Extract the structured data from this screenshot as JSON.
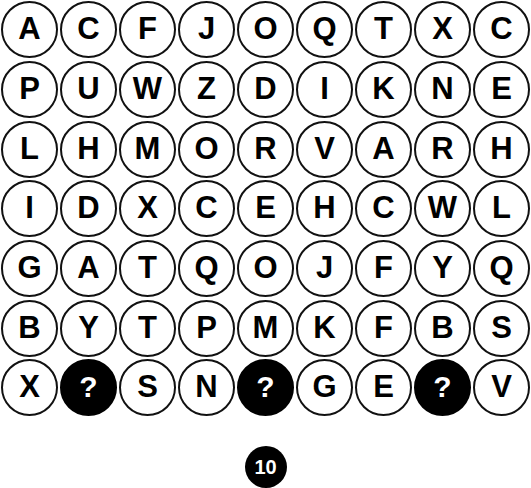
{
  "board": {
    "columns": 9,
    "rows": 7,
    "background_color": "#ffffff",
    "outline_color": "#111111",
    "letter_color": "#000000",
    "filled_color": "#000000",
    "filled_letter_color": "#ffffff",
    "cells": [
      [
        {
          "label": "A",
          "state": "open"
        },
        {
          "label": "C",
          "state": "open"
        },
        {
          "label": "F",
          "state": "open"
        },
        {
          "label": "J",
          "state": "open"
        },
        {
          "label": "O",
          "state": "open"
        },
        {
          "label": "Q",
          "state": "open"
        },
        {
          "label": "T",
          "state": "open"
        },
        {
          "label": "X",
          "state": "open"
        },
        {
          "label": "C",
          "state": "open"
        }
      ],
      [
        {
          "label": "P",
          "state": "open"
        },
        {
          "label": "U",
          "state": "open"
        },
        {
          "label": "W",
          "state": "open"
        },
        {
          "label": "Z",
          "state": "open"
        },
        {
          "label": "D",
          "state": "open"
        },
        {
          "label": "I",
          "state": "open"
        },
        {
          "label": "K",
          "state": "open"
        },
        {
          "label": "N",
          "state": "open"
        },
        {
          "label": "E",
          "state": "open"
        }
      ],
      [
        {
          "label": "L",
          "state": "open"
        },
        {
          "label": "H",
          "state": "open"
        },
        {
          "label": "M",
          "state": "open"
        },
        {
          "label": "O",
          "state": "open"
        },
        {
          "label": "R",
          "state": "open"
        },
        {
          "label": "V",
          "state": "open"
        },
        {
          "label": "A",
          "state": "open"
        },
        {
          "label": "R",
          "state": "open"
        },
        {
          "label": "H",
          "state": "open"
        }
      ],
      [
        {
          "label": "I",
          "state": "open"
        },
        {
          "label": "D",
          "state": "open"
        },
        {
          "label": "X",
          "state": "open"
        },
        {
          "label": "C",
          "state": "open"
        },
        {
          "label": "E",
          "state": "open"
        },
        {
          "label": "H",
          "state": "open"
        },
        {
          "label": "C",
          "state": "open"
        },
        {
          "label": "W",
          "state": "open"
        },
        {
          "label": "L",
          "state": "open"
        }
      ],
      [
        {
          "label": "G",
          "state": "open"
        },
        {
          "label": "A",
          "state": "open"
        },
        {
          "label": "T",
          "state": "open"
        },
        {
          "label": "Q",
          "state": "open"
        },
        {
          "label": "O",
          "state": "open"
        },
        {
          "label": "J",
          "state": "open"
        },
        {
          "label": "F",
          "state": "open"
        },
        {
          "label": "Y",
          "state": "open"
        },
        {
          "label": "Q",
          "state": "open"
        }
      ],
      [
        {
          "label": "B",
          "state": "open"
        },
        {
          "label": "Y",
          "state": "open"
        },
        {
          "label": "T",
          "state": "open"
        },
        {
          "label": "P",
          "state": "open"
        },
        {
          "label": "M",
          "state": "open"
        },
        {
          "label": "K",
          "state": "open"
        },
        {
          "label": "F",
          "state": "open"
        },
        {
          "label": "B",
          "state": "open"
        },
        {
          "label": "S",
          "state": "open"
        }
      ],
      [
        {
          "label": "X",
          "state": "open"
        },
        {
          "label": "?",
          "state": "filled"
        },
        {
          "label": "S",
          "state": "open"
        },
        {
          "label": "N",
          "state": "open"
        },
        {
          "label": "?",
          "state": "filled"
        },
        {
          "label": "G",
          "state": "open"
        },
        {
          "label": "E",
          "state": "open"
        },
        {
          "label": "?",
          "state": "filled"
        },
        {
          "label": "V",
          "state": "open"
        }
      ]
    ]
  },
  "counter": {
    "value": "10"
  }
}
